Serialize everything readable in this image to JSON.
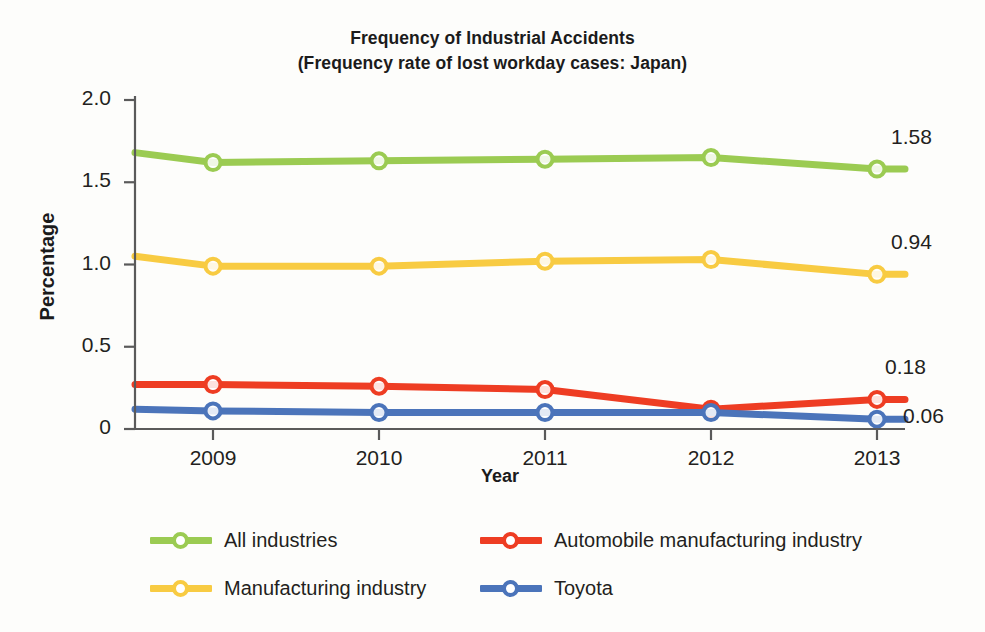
{
  "chart_data": {
    "type": "line",
    "title": "Frequency of Industrial Accidents",
    "subtitle": "(Frequency rate of lost workday cases: Japan)",
    "xlabel": "Year",
    "ylabel": "Percentage",
    "categories": [
      "2009",
      "2010",
      "2011",
      "2012",
      "2013"
    ],
    "x_tick_labels": [
      "2009",
      "2010",
      "2011",
      "2012",
      "2013"
    ],
    "y_tick_labels": [
      "0",
      "0.5",
      "1.0",
      "1.5",
      "2.0"
    ],
    "y_tick_values": [
      0,
      0.5,
      1.0,
      1.5,
      2.0
    ],
    "ylim": [
      0,
      2.0
    ],
    "grid": false,
    "legend_position": "bottom",
    "series": [
      {
        "name": "All industries",
        "color": "#9BCB52",
        "values": [
          1.62,
          1.63,
          1.64,
          1.65,
          1.58
        ],
        "lead_in_value": 1.68,
        "end_label": "1.58"
      },
      {
        "name": "Manufacturing industry",
        "color": "#F6C game",
        "values": [
          0.99,
          0.99,
          1.02,
          1.03,
          0.94
        ],
        "lead_in_value": 1.05,
        "end_label": "0.94"
      },
      {
        "name": "Automobile manufacturing industry",
        "color": "#EE3D23",
        "values": [
          0.27,
          0.26,
          0.24,
          0.12,
          0.18
        ],
        "lead_in_value": 0.27,
        "end_label": "0.18"
      },
      {
        "name": "Toyota",
        "color": "#4B74BA",
        "values": [
          0.11,
          0.1,
          0.1,
          0.1,
          0.06
        ],
        "lead_in_value": 0.12,
        "end_label": "0.06"
      }
    ],
    "point_labels": [
      {
        "text": "1.58",
        "series": "All industries"
      },
      {
        "text": "0.94",
        "series": "Manufacturing industry"
      },
      {
        "text": "0.18",
        "series": "Automobile manufacturing industry"
      },
      {
        "text": "0.06",
        "series": "Toyota"
      }
    ]
  },
  "colors": {
    "green": "#9BCB52",
    "yellow": "#F8CB42",
    "red": "#EE3D23",
    "blue": "#4B74BA",
    "axis": "#5a5a5a",
    "text": "#231f20",
    "background": "#fdfdfb"
  }
}
